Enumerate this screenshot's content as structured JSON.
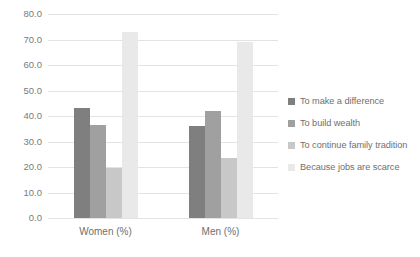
{
  "chart_data": {
    "type": "bar",
    "title": "",
    "subtitle": "",
    "xlabel": "",
    "ylabel": "",
    "categories": [
      "Women (%)",
      "Men (%)"
    ],
    "series": [
      {
        "name": "To make a difference",
        "values": [
          43.0,
          36.0
        ],
        "color": "#7f7f7f"
      },
      {
        "name": "To build wealth",
        "values": [
          36.5,
          42.0
        ],
        "color": "#a0a0a0"
      },
      {
        "name": "To continue family tradition",
        "values": [
          19.5,
          23.5
        ],
        "color": "#c8c8c8"
      },
      {
        "name": "Because jobs are scarce",
        "values": [
          73.0,
          69.0
        ],
        "color": "#e9e9e9"
      }
    ],
    "ylim": [
      0.0,
      80.0
    ],
    "ytick_step": 10.0,
    "ytick_labels": [
      "80.0",
      "70.0",
      "60.0",
      "50.0",
      "40.0",
      "30.0",
      "20.0",
      "10.0",
      "0.0"
    ],
    "ytick_values": [
      80.0,
      70.0,
      60.0,
      50.0,
      40.0,
      30.0,
      20.0,
      10.0,
      0.0
    ],
    "grid": true,
    "grid_color": "#e3e3e3",
    "legend_position": "right",
    "background_color": "#ffffff",
    "tick_label_color": "#7b7b7b",
    "axis_label_color": "#6f6f6f"
  }
}
